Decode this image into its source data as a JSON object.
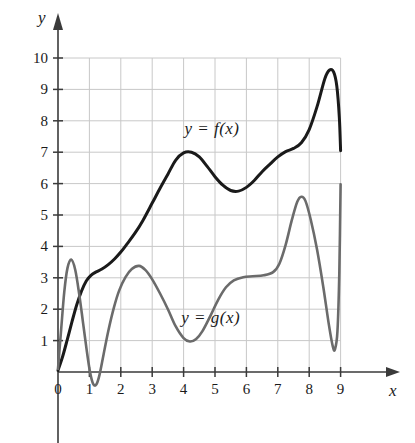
{
  "chart_data": {
    "type": "line",
    "title": "",
    "subtitle": "",
    "xlabel": "x",
    "ylabel": "y",
    "xlim": [
      0,
      9
    ],
    "ylim": [
      -0.6,
      10.4
    ],
    "grid": true,
    "grid_color": "#c8c8c8",
    "axis_color": "#3a3a3a",
    "background": "#ffffff",
    "legend_position": "inline-annotations",
    "xticks": [
      0,
      1,
      2,
      3,
      4,
      5,
      6,
      7,
      8,
      9
    ],
    "xtick_labels": [
      "0",
      "1",
      "2",
      "3",
      "4",
      "5",
      "6",
      "7",
      "8",
      "9"
    ],
    "yticks": [
      1,
      2,
      3,
      4,
      5,
      6,
      7,
      8,
      9,
      10
    ],
    "ytick_labels": [
      "1",
      "2",
      "3",
      "4",
      "5",
      "6",
      "7",
      "8",
      "9",
      "10"
    ],
    "series": [
      {
        "name": "y = f(x)",
        "label": "y = f(x)",
        "color": "#1a1a1a",
        "width": 3,
        "label_x": 5.3,
        "label_y": 7.75,
        "points": [
          [
            0.0,
            0.05
          ],
          [
            0.15,
            0.5
          ],
          [
            0.3,
            1.05
          ],
          [
            0.45,
            1.62
          ],
          [
            0.6,
            2.15
          ],
          [
            0.75,
            2.58
          ],
          [
            0.9,
            2.9
          ],
          [
            1.05,
            3.08
          ],
          [
            1.2,
            3.18
          ],
          [
            1.4,
            3.28
          ],
          [
            1.6,
            3.42
          ],
          [
            1.8,
            3.6
          ],
          [
            2.0,
            3.82
          ],
          [
            2.2,
            4.08
          ],
          [
            2.45,
            4.42
          ],
          [
            2.7,
            4.82
          ],
          [
            3.0,
            5.38
          ],
          [
            3.25,
            5.85
          ],
          [
            3.5,
            6.3
          ],
          [
            3.75,
            6.75
          ],
          [
            4.0,
            6.98
          ],
          [
            4.25,
            7.0
          ],
          [
            4.5,
            6.85
          ],
          [
            4.75,
            6.55
          ],
          [
            5.0,
            6.22
          ],
          [
            5.25,
            5.95
          ],
          [
            5.5,
            5.78
          ],
          [
            5.75,
            5.76
          ],
          [
            6.0,
            5.88
          ],
          [
            6.25,
            6.1
          ],
          [
            6.5,
            6.38
          ],
          [
            6.75,
            6.62
          ],
          [
            7.0,
            6.85
          ],
          [
            7.25,
            7.02
          ],
          [
            7.5,
            7.12
          ],
          [
            7.75,
            7.3
          ],
          [
            8.0,
            7.72
          ],
          [
            8.25,
            8.45
          ],
          [
            8.5,
            9.35
          ],
          [
            8.65,
            9.62
          ],
          [
            8.78,
            9.55
          ],
          [
            8.88,
            9.1
          ],
          [
            8.96,
            8.1
          ],
          [
            9.0,
            7.05
          ]
        ]
      },
      {
        "name": "y = g(x)",
        "label": "y = g(x)",
        "color": "#6b6b6b",
        "width": 2.6,
        "label_x": 5.2,
        "label_y": 1.72,
        "points": [
          [
            0.0,
            0.1
          ],
          [
            0.1,
            1.35
          ],
          [
            0.2,
            2.55
          ],
          [
            0.3,
            3.3
          ],
          [
            0.42,
            3.58
          ],
          [
            0.55,
            3.25
          ],
          [
            0.68,
            2.45
          ],
          [
            0.8,
            1.55
          ],
          [
            0.92,
            0.65
          ],
          [
            1.02,
            0.0
          ],
          [
            1.12,
            -0.38
          ],
          [
            1.22,
            -0.4
          ],
          [
            1.32,
            -0.1
          ],
          [
            1.45,
            0.55
          ],
          [
            1.6,
            1.3
          ],
          [
            1.78,
            2.05
          ],
          [
            1.95,
            2.6
          ],
          [
            2.15,
            3.02
          ],
          [
            2.35,
            3.28
          ],
          [
            2.58,
            3.38
          ],
          [
            2.78,
            3.25
          ],
          [
            3.0,
            2.95
          ],
          [
            3.25,
            2.5
          ],
          [
            3.5,
            2.0
          ],
          [
            3.75,
            1.45
          ],
          [
            4.0,
            1.08
          ],
          [
            4.2,
            0.97
          ],
          [
            4.4,
            1.05
          ],
          [
            4.6,
            1.3
          ],
          [
            4.85,
            1.78
          ],
          [
            5.1,
            2.3
          ],
          [
            5.35,
            2.7
          ],
          [
            5.6,
            2.92
          ],
          [
            5.9,
            3.02
          ],
          [
            6.2,
            3.05
          ],
          [
            6.55,
            3.08
          ],
          [
            6.85,
            3.18
          ],
          [
            7.05,
            3.45
          ],
          [
            7.25,
            4.05
          ],
          [
            7.45,
            4.85
          ],
          [
            7.62,
            5.42
          ],
          [
            7.75,
            5.58
          ],
          [
            7.88,
            5.45
          ],
          [
            8.05,
            4.85
          ],
          [
            8.25,
            3.9
          ],
          [
            8.45,
            2.7
          ],
          [
            8.62,
            1.55
          ],
          [
            8.75,
            0.82
          ],
          [
            8.82,
            0.72
          ],
          [
            8.9,
            1.3
          ],
          [
            8.96,
            3.2
          ],
          [
            9.0,
            5.98
          ]
        ]
      }
    ],
    "annotations": [
      {
        "text": "y = f(x)",
        "x": 5.3,
        "y": 7.75
      },
      {
        "text": "y = g(x)",
        "x": 5.2,
        "y": 1.72
      }
    ]
  }
}
